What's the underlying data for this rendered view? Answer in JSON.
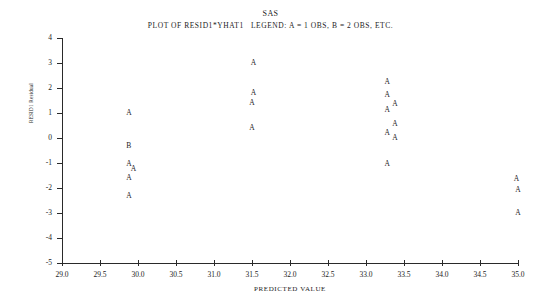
{
  "header": {
    "system_title": "SAS",
    "plot_caption": "PLOT OF RESID1*YHAT1   LEGEND: A = 1 OBS, B = 2 OBS, ETC."
  },
  "chart_data": {
    "type": "scatter",
    "title": "SAS",
    "subtitle": "PLOT OF RESID1*YHAT1   LEGEND: A = 1 OBS, B = 2 OBS, ETC.",
    "xlabel": "PREDICTED VALUE",
    "ylabel": "RESID1 Residual",
    "xlim": [
      29.0,
      35.0
    ],
    "ylim": [
      -5,
      4
    ],
    "grid": false,
    "legend": "A = 1 OBS, B = 2 OBS, ETC.",
    "legend_position": "none",
    "xticks": [
      "29.0",
      "29.5",
      "30.0",
      "30.5",
      "31.0",
      "31.5",
      "32.0",
      "32.5",
      "33.0",
      "33.5",
      "34.0",
      "34.5",
      "35.0"
    ],
    "xtick_values": [
      29.0,
      29.5,
      30.0,
      30.5,
      31.0,
      31.5,
      32.0,
      32.5,
      33.0,
      33.5,
      34.0,
      34.5,
      35.0
    ],
    "yticks": [
      "4",
      "3",
      "2",
      "1",
      "0",
      "-1",
      "-2",
      "-3",
      "-4",
      "-5"
    ],
    "ytick_values": [
      4,
      3,
      2,
      1,
      0,
      -1,
      -2,
      -3,
      -4,
      -5
    ],
    "points": [
      {
        "x": 29.88,
        "y": 1.0,
        "label": "A",
        "count": 1
      },
      {
        "x": 29.88,
        "y": -0.3,
        "label": "B",
        "count": 2
      },
      {
        "x": 29.88,
        "y": -1.05,
        "label": "A",
        "count": 1
      },
      {
        "x": 29.94,
        "y": -1.22,
        "label": "A",
        "count": 1
      },
      {
        "x": 29.88,
        "y": -1.6,
        "label": "A",
        "count": 1
      },
      {
        "x": 29.88,
        "y": -2.3,
        "label": "A",
        "count": 1
      },
      {
        "x": 31.52,
        "y": 3.0,
        "label": "A",
        "count": 1
      },
      {
        "x": 31.52,
        "y": 1.8,
        "label": "A",
        "count": 1
      },
      {
        "x": 31.5,
        "y": 1.4,
        "label": "A",
        "count": 1
      },
      {
        "x": 31.5,
        "y": 0.42,
        "label": "A",
        "count": 1
      },
      {
        "x": 33.28,
        "y": 2.25,
        "label": "A",
        "count": 1
      },
      {
        "x": 33.28,
        "y": 1.72,
        "label": "A",
        "count": 1
      },
      {
        "x": 33.38,
        "y": 1.38,
        "label": "A",
        "count": 1
      },
      {
        "x": 33.28,
        "y": 1.12,
        "label": "A",
        "count": 1
      },
      {
        "x": 33.38,
        "y": 0.58,
        "label": "A",
        "count": 1
      },
      {
        "x": 33.28,
        "y": 0.22,
        "label": "A",
        "count": 1
      },
      {
        "x": 33.38,
        "y": 0.02,
        "label": "A",
        "count": 1
      },
      {
        "x": 33.28,
        "y": -1.02,
        "label": "A",
        "count": 1
      },
      {
        "x": 34.98,
        "y": -1.62,
        "label": "A",
        "count": 1
      },
      {
        "x": 35.0,
        "y": -2.08,
        "label": "A",
        "count": 1
      },
      {
        "x": 35.0,
        "y": -3.0,
        "label": "A",
        "count": 1
      }
    ]
  }
}
